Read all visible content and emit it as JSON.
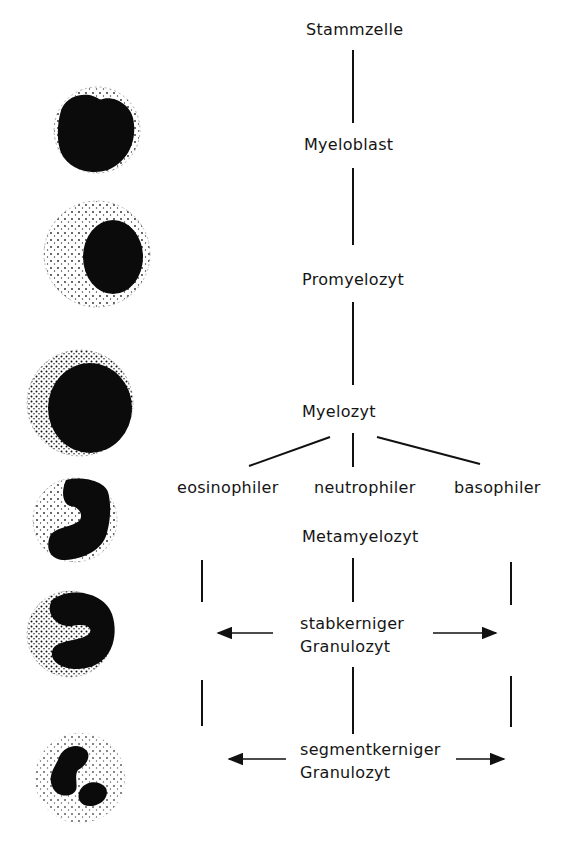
{
  "diagram": {
    "stages": {
      "stammzelle": "Stammzelle",
      "myeloblast": "Myeloblast",
      "promyelozyt": "Promyelozyt",
      "myelozyt": "Myelozyt",
      "metamyelozyt": "Metamyelozyt",
      "stabkerniger_line1": "stabkerniger",
      "stabkerniger_line2": "Granulozyt",
      "segmentkerniger_line1": "segmentkerniger",
      "segmentkerniger_line2": "Granulozyt"
    },
    "branches": {
      "eosinophiler": "eosinophiler",
      "neutrophiler": "neutrophiler",
      "basophiler": "basophiler"
    },
    "cell_illustrations": [
      "myeloblast-cell",
      "promyelocyte-cell",
      "myelocyte-cell",
      "metamyelocyte-cell",
      "band-granulocyte-cell",
      "segmented-granulocyte-cell"
    ],
    "colors": {
      "ink": "#111111",
      "background": "#ffffff"
    }
  }
}
